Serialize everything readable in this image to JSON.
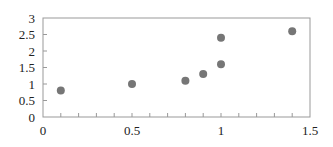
{
  "chart_data": {
    "type": "scatter",
    "title": "",
    "xlabel": "",
    "ylabel": "",
    "xlim": [
      0,
      1.5
    ],
    "ylim": [
      0,
      3
    ],
    "x_ticks": [
      0,
      0.5,
      1,
      1.5
    ],
    "x_tick_labels": [
      "0",
      "0.5",
      "1",
      "1.5"
    ],
    "x_minor_step": 0.1,
    "y_ticks": [
      0,
      0.5,
      1,
      1.5,
      2,
      2.5,
      3
    ],
    "y_tick_labels": [
      "0",
      "0.5",
      "1",
      "1.5",
      "2",
      "2.5",
      "3"
    ],
    "grid": false,
    "legend": null,
    "series": [
      {
        "name": "Series 1",
        "color": "#767676",
        "points": [
          {
            "x": 0.1,
            "y": 0.8
          },
          {
            "x": 0.5,
            "y": 1.0
          },
          {
            "x": 0.8,
            "y": 1.1
          },
          {
            "x": 0.9,
            "y": 1.3
          },
          {
            "x": 1.0,
            "y": 1.6
          },
          {
            "x": 1.0,
            "y": 2.4
          },
          {
            "x": 1.4,
            "y": 2.6
          }
        ]
      }
    ]
  },
  "style": {
    "axis_color": "#999999",
    "point_color": "#767676"
  }
}
